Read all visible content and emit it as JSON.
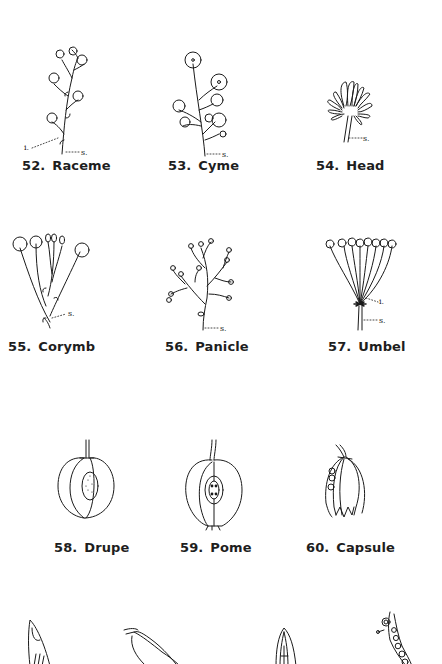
{
  "page": {
    "type": "botanical illustration plate",
    "background": "#ffffff",
    "ink_color": "#1a1a1a"
  },
  "figures": [
    {
      "number": "52.",
      "name": "Raceme",
      "annotations": [
        "i.",
        "s."
      ]
    },
    {
      "number": "53.",
      "name": "Cyme",
      "annotations": [
        "s."
      ]
    },
    {
      "number": "54.",
      "name": "Head",
      "annotations": [
        "s."
      ]
    },
    {
      "number": "55.",
      "name": "Corymb",
      "annotations": [
        "s."
      ]
    },
    {
      "number": "56.",
      "name": "Panicle",
      "annotations": [
        "s."
      ]
    },
    {
      "number": "57.",
      "name": "Umbel",
      "annotations": [
        "i.",
        "s."
      ]
    },
    {
      "number": "58.",
      "name": "Drupe",
      "annotations": []
    },
    {
      "number": "59.",
      "name": "Pome",
      "annotations": []
    },
    {
      "number": "60.",
      "name": "Capsule",
      "annotations": []
    }
  ],
  "partial_row": {
    "description": "Top portions of four further fruit illustrations, cut off at bottom edge",
    "count": 4
  }
}
